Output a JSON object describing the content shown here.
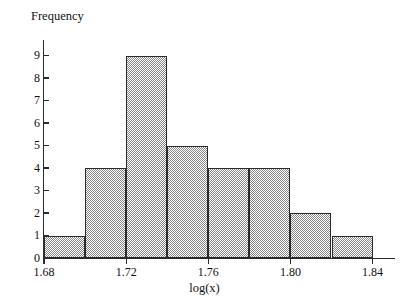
{
  "chart_data": {
    "type": "bar",
    "title": "",
    "subtitle": "",
    "xlabel": "log(x)",
    "ylabel": "Frequency",
    "grid": false,
    "legend": null,
    "legend_position": "none",
    "bin_width": 0.02,
    "bin_edges": [
      1.68,
      1.7,
      1.72,
      1.74,
      1.76,
      1.78,
      1.8,
      1.82,
      1.84
    ],
    "categories": [
      "1.68-1.70",
      "1.70-1.72",
      "1.72-1.74",
      "1.74-1.76",
      "1.76-1.78",
      "1.78-1.80",
      "1.80-1.82",
      "1.82-1.84"
    ],
    "values": [
      1,
      4,
      9,
      5,
      4,
      4,
      2,
      1
    ],
    "xlim": [
      1.68,
      1.848
    ],
    "ylim": [
      0,
      9.6
    ],
    "xticks": [
      1.68,
      1.72,
      1.76,
      1.8,
      1.84
    ],
    "xtick_labels": [
      "1.68",
      "1.72",
      "1.76",
      "1.80",
      "1.84"
    ],
    "yticks": [
      0,
      1,
      2,
      3,
      4,
      5,
      6,
      7,
      8,
      9
    ],
    "ytick_labels": [
      "0",
      "1",
      "2",
      "3",
      "4",
      "5",
      "6",
      "7",
      "8",
      "9"
    ],
    "bar_fill": "#8a8a8a",
    "bar_edge_color": "#2b2b2b",
    "axis_color": "#2b2b2b",
    "background": "#ffffff"
  }
}
